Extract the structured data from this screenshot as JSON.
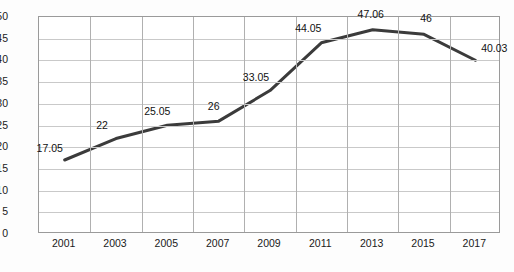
{
  "chart_data": {
    "type": "line",
    "title": "",
    "subtitle": "",
    "xlabel": "",
    "ylabel": "",
    "categories": [
      "2001",
      "2003",
      "2005",
      "2007",
      "2009",
      "2011",
      "2013",
      "2015",
      "2017"
    ],
    "values": [
      17.05,
      22,
      25.05,
      26,
      33.05,
      44.05,
      47.06,
      46,
      40.03
    ],
    "point_labels": [
      "17.05",
      "22",
      "25.05",
      "26",
      "33.05",
      "44.05",
      "47.06",
      "46",
      "40.03"
    ],
    "ylim": [
      0,
      50
    ],
    "ytick_step": 5,
    "ytick_labels": [
      "0",
      "5",
      "10",
      "15",
      "20",
      "25",
      "30",
      "35",
      "40",
      "45",
      "50"
    ],
    "grid": "both",
    "legend": "none",
    "series": [
      {
        "name": "",
        "values": [
          17.05,
          22,
          25.05,
          26,
          33.05,
          44.05,
          47.06,
          46,
          40.03
        ],
        "line_color": "#3b3b3b",
        "line_width": 3,
        "markers": false
      }
    ],
    "colors": {
      "line": "#3b3b3b",
      "plot_border": "#9a9a9a",
      "hgrid": "#c9c9c9",
      "vgrid": "#b0b0b0",
      "text": "#1a1a1a",
      "background": "#ffffff"
    }
  }
}
